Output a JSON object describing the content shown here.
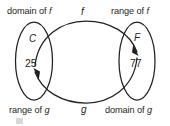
{
  "diagram": {
    "stroke_color": "#231f20",
    "background_color": "#ffffff",
    "labels": {
      "domain_f": "domain of f",
      "range_f": "range of f",
      "range_g": "range of g",
      "domain_g": "domain of g",
      "curve_f": "f",
      "curve_g": "g"
    },
    "sets": {
      "left": {
        "name": "C",
        "element": "25"
      },
      "right": {
        "name": "F",
        "element": "77"
      }
    },
    "arrows": [
      {
        "name": "f-arrow",
        "from": "25",
        "to": "77",
        "direction": "left-to-right",
        "label": "f"
      },
      {
        "name": "g-arrow",
        "from": "77",
        "to": "25",
        "direction": "right-to-left",
        "label": "g"
      }
    ]
  }
}
